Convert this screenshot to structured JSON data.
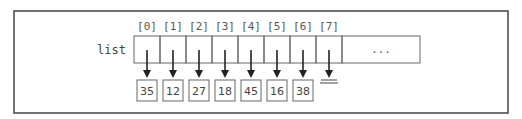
{
  "diagram": {
    "variable_label": "list",
    "indices": [
      "[0]",
      "[1]",
      "[2]",
      "[3]",
      "[4]",
      "[5]",
      "[6]",
      "[7]"
    ],
    "values": [
      "35",
      "12",
      "27",
      "18",
      "45",
      "16",
      "38",
      null
    ],
    "ellipsis": "...",
    "null_slot_index": 7,
    "colors": {
      "stroke": "#555555",
      "text": "#444444",
      "arrow": "#222222"
    }
  }
}
